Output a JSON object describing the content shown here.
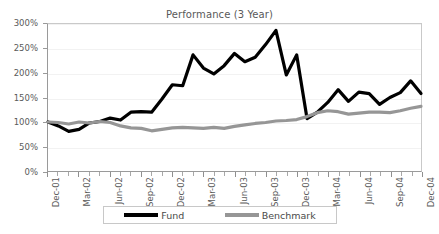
{
  "chart_data": {
    "type": "line",
    "title": "Performance (3 Year)",
    "xlabel": "",
    "ylabel": "",
    "ylim": [
      0,
      300
    ],
    "ytick_labels": [
      "0%",
      "50%",
      "100%",
      "150%",
      "200%",
      "250%",
      "300%"
    ],
    "ytick_values": [
      0,
      50,
      100,
      150,
      200,
      250,
      300
    ],
    "grid": true,
    "legend_position": "bottom",
    "x": [
      "Dec-01",
      "Jan-02",
      "Feb-02",
      "Mar-02",
      "Apr-02",
      "May-02",
      "Jun-02",
      "Jul-02",
      "Aug-02",
      "Sep-02",
      "Oct-02",
      "Nov-02",
      "Dec-02",
      "Jan-03",
      "Feb-03",
      "Mar-03",
      "Apr-03",
      "May-03",
      "Jun-03",
      "Jul-03",
      "Aug-03",
      "Sep-03",
      "Oct-03",
      "Nov-03",
      "Dec-03",
      "Jan-04",
      "Feb-04",
      "Mar-04",
      "Apr-04",
      "May-04",
      "Jun-04",
      "Jul-04",
      "Aug-04",
      "Sep-04",
      "Oct-04",
      "Nov-04",
      "Dec-04"
    ],
    "xtick_labels": [
      "Dec-01",
      "Mar-02",
      "Jun-02",
      "Sep-02",
      "Dec-02",
      "Mar-03",
      "Jun-03",
      "Sep-03",
      "Dec-03",
      "Mar-04",
      "Jun-04",
      "Sep-04",
      "Dec-04"
    ],
    "series": [
      {
        "name": "Fund",
        "color": "#000000",
        "width": 3.2,
        "values": [
          100,
          92,
          81,
          85,
          98,
          101,
          108,
          104,
          120,
          121,
          120,
          147,
          176,
          174,
          237,
          210,
          198,
          215,
          240,
          223,
          232,
          258,
          287,
          196,
          237,
          107,
          120,
          140,
          166,
          142,
          161,
          158,
          136,
          150,
          160,
          184,
          158
        ]
      },
      {
        "name": "Benchmark",
        "color": "#969696",
        "width": 3.2,
        "values": [
          100,
          99,
          96,
          100,
          98,
          101,
          99,
          92,
          88,
          87,
          82,
          85,
          88,
          89,
          88,
          87,
          89,
          87,
          91,
          94,
          97,
          99,
          102,
          103,
          105,
          111,
          119,
          123,
          121,
          116,
          118,
          120,
          120,
          119,
          123,
          128,
          132
        ]
      }
    ]
  },
  "legend": {
    "items": [
      {
        "label": "Fund",
        "color": "#000000"
      },
      {
        "label": "Benchmark",
        "color": "#969696"
      }
    ]
  }
}
